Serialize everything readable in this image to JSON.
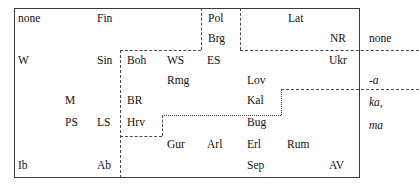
{
  "figure": {
    "title": "",
    "outer_box": {
      "x": 14,
      "y": 8,
      "width": 346,
      "height": 170
    },
    "cells": [
      {
        "label": "none",
        "x": 18,
        "y": 12,
        "italic": false
      },
      {
        "label": "Fin",
        "x": 97,
        "y": 12,
        "italic": false
      },
      {
        "label": "Pol",
        "x": 208,
        "y": 12,
        "italic": false
      },
      {
        "label": "Lat",
        "x": 288,
        "y": 12,
        "italic": false
      },
      {
        "label": "Brg",
        "x": 208,
        "y": 32,
        "italic": false
      },
      {
        "label": "NR",
        "x": 330,
        "y": 32,
        "italic": false
      },
      {
        "label": "none",
        "x": 369,
        "y": 32,
        "italic": false
      },
      {
        "label": "W",
        "x": 18,
        "y": 54,
        "italic": false
      },
      {
        "label": "Sin",
        "x": 97,
        "y": 54,
        "italic": false
      },
      {
        "label": "Boh",
        "x": 127,
        "y": 54,
        "italic": false
      },
      {
        "label": "WS",
        "x": 167,
        "y": 54,
        "italic": false
      },
      {
        "label": "ES",
        "x": 207,
        "y": 54,
        "italic": false
      },
      {
        "label": "Ukr",
        "x": 329,
        "y": 54,
        "italic": false
      },
      {
        "label": "Rmg",
        "x": 167,
        "y": 74,
        "italic": false
      },
      {
        "label": "Lov",
        "x": 247,
        "y": 74,
        "italic": false
      },
      {
        "label": "-a",
        "x": 369,
        "y": 74,
        "italic": true
      },
      {
        "label": "M",
        "x": 65,
        "y": 94,
        "italic": false
      },
      {
        "label": "BR",
        "x": 127,
        "y": 94,
        "italic": false
      },
      {
        "label": "Kal",
        "x": 247,
        "y": 94,
        "italic": false
      },
      {
        "label": "ka,",
        "x": 369,
        "y": 96,
        "italic": true
      },
      {
        "label": "PS",
        "x": 65,
        "y": 116,
        "italic": false
      },
      {
        "label": "LS",
        "x": 97,
        "y": 116,
        "italic": false
      },
      {
        "label": "Hrv",
        "x": 127,
        "y": 116,
        "italic": false
      },
      {
        "label": "Bug",
        "x": 247,
        "y": 116,
        "italic": false
      },
      {
        "label": "ma",
        "x": 369,
        "y": 119,
        "italic": true
      },
      {
        "label": "Gur",
        "x": 167,
        "y": 138,
        "italic": false
      },
      {
        "label": "Arl",
        "x": 207,
        "y": 138,
        "italic": false
      },
      {
        "label": "Erl",
        "x": 247,
        "y": 138,
        "italic": false
      },
      {
        "label": "Rum",
        "x": 287,
        "y": 138,
        "italic": false
      },
      {
        "label": "Ib",
        "x": 18,
        "y": 159,
        "italic": false
      },
      {
        "label": "Ab",
        "x": 97,
        "y": 159,
        "italic": false
      },
      {
        "label": "Sep",
        "x": 247,
        "y": 159,
        "italic": false
      },
      {
        "label": "AV",
        "x": 329,
        "y": 159,
        "italic": false
      }
    ],
    "segments": [
      {
        "name": "pol-left-divider",
        "dir": "v",
        "x": 201,
        "y": 8,
        "len": 42,
        "style": "dashed"
      },
      {
        "name": "lat-left-divider",
        "dir": "v",
        "x": 240,
        "y": 8,
        "len": 42,
        "style": "dashed"
      },
      {
        "name": "boh-top-divider",
        "dir": "h",
        "x": 120,
        "y": 50,
        "len": 81,
        "style": "dashed"
      },
      {
        "name": "ukr-top-divider",
        "dir": "h",
        "x": 240,
        "y": 50,
        "len": 179,
        "style": "dashed"
      },
      {
        "name": "west-slavic-left-divider",
        "dir": "v",
        "x": 120,
        "y": 50,
        "len": 128,
        "style": "dashed"
      },
      {
        "name": "kal-top-divider",
        "dir": "h",
        "x": 281,
        "y": 89,
        "len": 138,
        "style": "dashed"
      },
      {
        "name": "kal-left-divider",
        "dir": "v",
        "x": 281,
        "y": 89,
        "len": 26,
        "style": "dotted"
      },
      {
        "name": "bug-top-divider",
        "dir": "h",
        "x": 162,
        "y": 115,
        "len": 119,
        "style": "dotted"
      },
      {
        "name": "hrv-right-divider",
        "dir": "v",
        "x": 162,
        "y": 115,
        "len": 21,
        "style": "dashed"
      },
      {
        "name": "hrv-bottom-divider",
        "dir": "h",
        "x": 120,
        "y": 136,
        "len": 42,
        "style": "dashed"
      }
    ]
  }
}
